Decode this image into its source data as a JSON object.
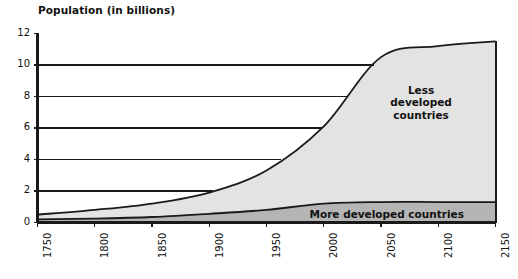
{
  "chart_data": {
    "type": "area",
    "title": "Population (in billions)",
    "xlabel": "",
    "ylabel": "Population (in billions)",
    "xlim": [
      1750,
      2150
    ],
    "ylim": [
      0,
      12
    ],
    "grid": true,
    "stacked": true,
    "legend_position": "inline-annotation",
    "x": [
      1750,
      1800,
      1850,
      1900,
      1950,
      2000,
      2050,
      2100,
      2150
    ],
    "xticks": [
      "1750",
      "1800",
      "1850",
      "1900",
      "1950",
      "2000",
      "2050",
      "2100",
      "2150"
    ],
    "yticks": [
      "0",
      "2",
      "4",
      "6",
      "8",
      "10",
      "12"
    ],
    "series": [
      {
        "name": "More developed countries",
        "color": "#b3b3b3",
        "values": [
          0.2,
          0.25,
          0.35,
          0.55,
          0.8,
          1.2,
          1.3,
          1.3,
          1.3
        ]
      },
      {
        "name": "Less developed countries",
        "color": "#e0e0e0",
        "values": [
          0.3,
          0.55,
          0.85,
          1.35,
          2.5,
          4.9,
          9.2,
          9.9,
          10.2
        ]
      }
    ],
    "totals": [
      0.5,
      0.8,
      1.2,
      1.9,
      3.3,
      6.1,
      10.5,
      11.2,
      11.5
    ],
    "annotations": [
      {
        "text": "Less\ndeveloped\ncountries",
        "x": 2085,
        "y": 7.6
      },
      {
        "text": "More developed countries",
        "x": 2055,
        "y": 0.55
      }
    ]
  },
  "axis": {
    "ytick_values": [
      12,
      10,
      8,
      6,
      4,
      2,
      0
    ],
    "xtick_values": [
      1750,
      1800,
      1850,
      1900,
      1950,
      2000,
      2050,
      2100,
      2150
    ]
  },
  "colors": {
    "less_developed_fill": "#e3e3e3",
    "more_developed_fill": "#b5b5b5",
    "axis": "#1a1a1a",
    "gridline": "#1a1a1a",
    "background": "#ffffff"
  }
}
